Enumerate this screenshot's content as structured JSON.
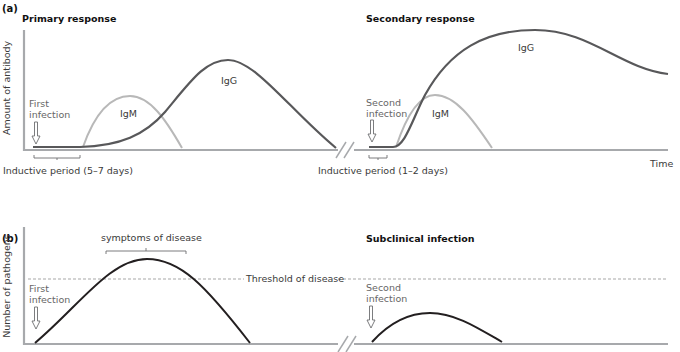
{
  "figure": {
    "panel_a": {
      "label": "(a)",
      "y_axis_label": "Amount of antibody",
      "x_axis_label": "Time",
      "primary": {
        "title": "Primary response",
        "infection_label_line1": "First",
        "infection_label_line2": "infection",
        "inductive_period": "Inductive period (5–7 days)",
        "igm_label": "IgM",
        "igg_label": "IgG"
      },
      "secondary": {
        "title": "Secondary response",
        "infection_label_line1": "Second",
        "infection_label_line2": "infection",
        "inductive_period": "Inductive period (1–2 days)",
        "igm_label": "IgM",
        "igg_label": "IgG"
      }
    },
    "panel_b": {
      "label": "(b)",
      "y_axis_label": "Number of pathogens",
      "threshold_label": "Threshold of disease",
      "first": {
        "symptoms_label": "symptoms of disease",
        "infection_label_line1": "First",
        "infection_label_line2": "infection"
      },
      "second": {
        "title": "Subclinical infection",
        "infection_label_line1": "Second",
        "infection_label_line2": "infection"
      }
    },
    "colors": {
      "axis": "#a7a9ac",
      "igg": "#58585a",
      "igm": "#b8b8b8",
      "pathogen_curve": "#231f20",
      "threshold": "#9d9d9d",
      "arrow": "#6d6e71"
    }
  }
}
